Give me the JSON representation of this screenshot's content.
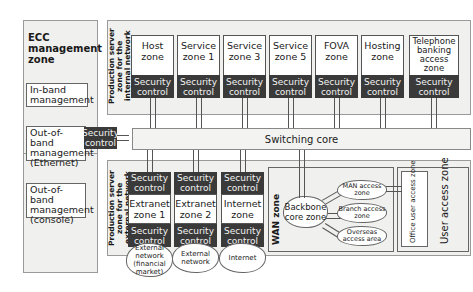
{
  "ecc": {
    "title": "ECC management zone",
    "inband": "In-band management",
    "oob_ethernet": "Out-of-band management (Ethernet)",
    "oob_console": "Out-of-band management (console)"
  },
  "security_control": "Security control",
  "internal_zone": {
    "label": "Production server zone for the internal network",
    "zones": [
      "Host zone",
      "Service zone 1",
      "Service zone 3",
      "Service zone 5",
      "FOVA zone",
      "Hosting zone",
      "Telephone banking access zone"
    ]
  },
  "switching_core": "Switching core",
  "external_zone": {
    "label": "Production server zone for the external network",
    "zones": [
      "Extranet zone 1",
      "Extranet zone 2",
      "Internet zone"
    ],
    "clouds": [
      "External network (financial market)",
      "External network",
      "Internet"
    ]
  },
  "wan": {
    "label": "WAN zone",
    "core": "Backbone core zone",
    "access": [
      "MAN access zone",
      "Branch access zone",
      "Overseas access area"
    ]
  },
  "user_access": {
    "label": "User access zone",
    "office": "Office user access zone"
  }
}
